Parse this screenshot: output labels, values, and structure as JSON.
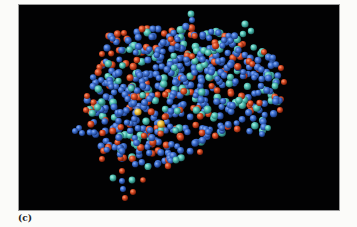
{
  "figure": {
    "panel_label": "(c)",
    "background_color": "#020203"
  },
  "atom_colors": {
    "blue": "#3c6fd1",
    "teal": "#4fc1b4",
    "red": "#d84a22",
    "yellow": "#f2c23a"
  },
  "atoms": {
    "accent_atoms": [
      {
        "x": 138,
        "y": 112,
        "c": "yellow",
        "r": 3.6
      },
      {
        "x": 161,
        "y": 124,
        "c": "yellow",
        "r": 3.8
      },
      {
        "x": 191,
        "y": 14,
        "c": "teal",
        "r": 3.4
      },
      {
        "x": 192,
        "y": 20,
        "c": "blue",
        "r": 3.0
      },
      {
        "x": 245,
        "y": 24,
        "c": "teal",
        "r": 3.6
      },
      {
        "x": 251,
        "y": 31,
        "c": "teal",
        "r": 3.2
      },
      {
        "x": 243,
        "y": 34,
        "c": "teal",
        "r": 3.2
      },
      {
        "x": 142,
        "y": 29,
        "c": "red",
        "r": 3.4
      },
      {
        "x": 124,
        "y": 33,
        "c": "red",
        "r": 3.0
      },
      {
        "x": 79,
        "y": 128,
        "c": "blue",
        "r": 3.0
      },
      {
        "x": 75,
        "y": 131,
        "c": "blue",
        "r": 3.0
      },
      {
        "x": 82,
        "y": 133,
        "c": "blue",
        "r": 3.0
      },
      {
        "x": 113,
        "y": 178,
        "c": "teal",
        "r": 3.4
      },
      {
        "x": 122,
        "y": 181,
        "c": "blue",
        "r": 3.0
      },
      {
        "x": 132,
        "y": 180,
        "c": "teal",
        "r": 3.4
      },
      {
        "x": 123,
        "y": 189,
        "c": "blue",
        "r": 3.0
      },
      {
        "x": 133,
        "y": 192,
        "c": "red",
        "r": 3.0
      },
      {
        "x": 125,
        "y": 198,
        "c": "red",
        "r": 3.0
      },
      {
        "x": 122,
        "y": 171,
        "c": "red",
        "r": 3.0
      },
      {
        "x": 143,
        "y": 180,
        "c": "red",
        "r": 2.8
      },
      {
        "x": 168,
        "y": 166,
        "c": "red",
        "r": 3.2
      },
      {
        "x": 176,
        "y": 160,
        "c": "teal",
        "r": 3.4
      },
      {
        "x": 284,
        "y": 82,
        "c": "red",
        "r": 3.0
      },
      {
        "x": 281,
        "y": 68,
        "c": "red",
        "r": 3.0
      },
      {
        "x": 275,
        "y": 86,
        "c": "teal",
        "r": 3.4
      },
      {
        "x": 264,
        "y": 52,
        "c": "red",
        "r": 3.0
      },
      {
        "x": 280,
        "y": 110,
        "c": "red",
        "r": 3.0
      },
      {
        "x": 268,
        "y": 128,
        "c": "teal",
        "r": 3.0
      },
      {
        "x": 262,
        "y": 134,
        "c": "blue",
        "r": 3.0
      },
      {
        "x": 102,
        "y": 54,
        "c": "red",
        "r": 3.0
      },
      {
        "x": 87,
        "y": 96,
        "c": "red",
        "r": 3.0
      },
      {
        "x": 86,
        "y": 110,
        "c": "red",
        "r": 3.0
      },
      {
        "x": 102,
        "y": 159,
        "c": "red",
        "r": 3.0
      },
      {
        "x": 200,
        "y": 152,
        "c": "red",
        "r": 3.0
      }
    ],
    "body_outline_polygon": [
      [
        108,
        36
      ],
      [
        125,
        30
      ],
      [
        150,
        28
      ],
      [
        175,
        22
      ],
      [
        200,
        26
      ],
      [
        222,
        30
      ],
      [
        240,
        36
      ],
      [
        258,
        46
      ],
      [
        272,
        56
      ],
      [
        282,
        70
      ],
      [
        285,
        88
      ],
      [
        280,
        104
      ],
      [
        272,
        118
      ],
      [
        262,
        132
      ],
      [
        246,
        132
      ],
      [
        230,
        128
      ],
      [
        215,
        138
      ],
      [
        200,
        148
      ],
      [
        182,
        158
      ],
      [
        165,
        163
      ],
      [
        150,
        170
      ],
      [
        138,
        168
      ],
      [
        126,
        160
      ],
      [
        110,
        156
      ],
      [
        98,
        150
      ],
      [
        90,
        138
      ],
      [
        84,
        120
      ],
      [
        86,
        100
      ],
      [
        90,
        84
      ],
      [
        98,
        66
      ],
      [
        104,
        50
      ]
    ],
    "fill_count": 620,
    "fill_seed": 7,
    "fill_mix": {
      "blue": 0.6,
      "teal": 0.2,
      "red": 0.2
    },
    "fill_radius": 3.3
  }
}
